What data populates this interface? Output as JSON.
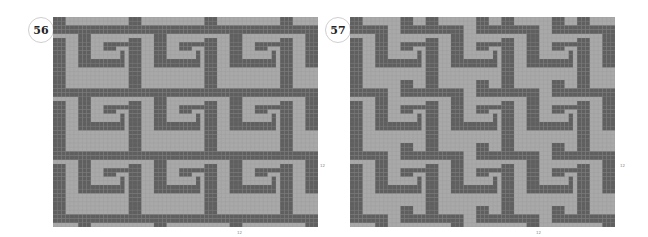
{
  "charts": [
    {
      "number": "56",
      "x": 53,
      "y": 17,
      "width": 265,
      "height": 210,
      "cols": 63,
      "rows": 50,
      "colors": {
        "dark": "#5f5f5f",
        "light": "#a9a9a9",
        "grid": "#8a8a8a"
      },
      "motif": [
        "DDD...............",
        "DDD...............",
        "DDDDDDDDDDDDDDDDDD",
        "DDDDDDDDDDDDDDDDDD",
        "......DDD.........",
        "DDD...DDD.........",
        "DDD...DDD...DDDDDD",
        "DDD...DDD...DDD...",
        "DDD...DDD.......D.",
        "DDD...DDD.......D.",
        "DDD...DDDDDDDDDDD.",
        "DDD...DDDDDDDDDDD.",
        "DDD...............",
        "DDD...............",
        "DDD..............."
      ],
      "side_label": "12",
      "bottom_label": "12"
    },
    {
      "number": "57",
      "x": 350,
      "y": 17,
      "width": 265,
      "height": 210,
      "cols": 63,
      "rows": 50,
      "colors": {
        "dark": "#5f5f5f",
        "light": "#a9a9a9",
        "grid": "#8a8a8a"
      },
      "motif": [
        "DDD.........DDD...",
        "DDD.........DDD...",
        "DDDDDDDDD...DDDDDD",
        "DDDDDDDDD...DDDDDD",
        "......DDD.........",
        "DDD...DDD.........",
        "DDD...DDD...DDDDDD",
        "DDD...DDD...DDD...",
        "DDD...DDD.......D.",
        "DDD...DDD.......D.",
        "DDD...DDDDDDDDDDD.",
        "DDD...DDDDDDDDDDD.",
        "DDD...............",
        "DDD...............",
        "DDD..............."
      ],
      "side_label": "12",
      "bottom_label": "12"
    }
  ]
}
